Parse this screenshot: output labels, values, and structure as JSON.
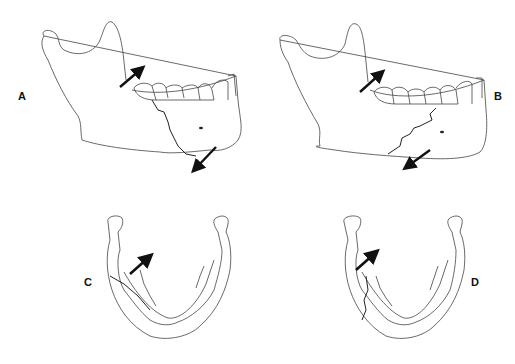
{
  "figure": {
    "panels": [
      {
        "id": "A",
        "label": "A",
        "view": "lateral mandible",
        "fracture": "angle fracture, oblique line running down and back from molar region",
        "arrows": [
          "upward-posterior pull on ramus",
          "downward-anterior pull on body"
        ]
      },
      {
        "id": "B",
        "label": "B",
        "view": "lateral mandible",
        "fracture": "angle fracture, line running down and forward from molar region",
        "arrows": [
          "upward pull on ramus",
          "downward pull on body"
        ]
      },
      {
        "id": "C",
        "label": "C",
        "view": "occlusal (superior) view of mandible",
        "fracture": "oblique fracture through left body",
        "arrows": [
          "medial-forward displacement"
        ]
      },
      {
        "id": "D",
        "label": "D",
        "view": "occlusal (superior) view of mandible",
        "fracture": "vertical fracture through left body",
        "arrows": [
          "medial-forward displacement"
        ]
      }
    ],
    "caption_truncated": true
  },
  "colors": {
    "line": "#333333",
    "arrow": "#111111",
    "background": "#ffffff"
  }
}
